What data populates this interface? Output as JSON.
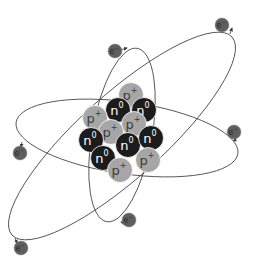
{
  "diagram": {
    "type": "atom-model",
    "colors": {
      "background": "#ffffff",
      "proton_fill": "#a6a6a6",
      "neutron_fill": "#1c1c1c",
      "electron_fill": "#5e5e5e",
      "orbit_stroke": "#3a3a3a",
      "particle_stroke": "#ffffff",
      "proton_text": "#3c3c3c",
      "neutron_text": "#ffffff",
      "electron_text": "#2a2a2a"
    },
    "labels": {
      "proton": "p",
      "proton_sup": "+",
      "neutron": "n",
      "neutron_sup": "0",
      "electron": "e",
      "electron_sup": "−"
    },
    "nucleus": [
      {
        "kind": "proton",
        "x": 131,
        "y": 95
      },
      {
        "kind": "neutron",
        "x": 118,
        "y": 110
      },
      {
        "kind": "neutron",
        "x": 144,
        "y": 110
      },
      {
        "kind": "proton",
        "x": 95,
        "y": 118
      },
      {
        "kind": "proton",
        "x": 134,
        "y": 124
      },
      {
        "kind": "proton",
        "x": 111,
        "y": 132
      },
      {
        "kind": "neutron",
        "x": 91,
        "y": 140
      },
      {
        "kind": "neutron",
        "x": 128,
        "y": 145
      },
      {
        "kind": "neutron",
        "x": 151,
        "y": 138
      },
      {
        "kind": "neutron",
        "x": 103,
        "y": 158
      },
      {
        "kind": "proton",
        "x": 148,
        "y": 160
      },
      {
        "kind": "proton",
        "x": 120,
        "y": 170
      }
    ],
    "electrons": [
      {
        "x": 115,
        "y": 51
      },
      {
        "x": 222,
        "y": 25
      },
      {
        "x": 20,
        "y": 153
      },
      {
        "x": 234,
        "y": 132
      },
      {
        "x": 129,
        "y": 220
      },
      {
        "x": 21,
        "y": 248
      }
    ],
    "counts": {
      "protons": 6,
      "neutrons": 6,
      "electrons": 6
    }
  }
}
